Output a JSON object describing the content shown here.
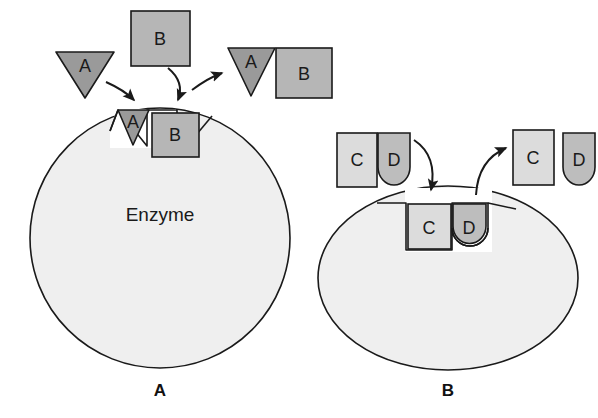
{
  "figure": {
    "background_color": "#ffffff"
  },
  "colors": {
    "enzyme_fill": "#efefef",
    "enzyme_stroke": "#1a1a1a",
    "substrate_a_fill": "#9a9a9a",
    "substrate_b_fill": "#b6b6b6",
    "substrate_c_fill": "#dcdcdc",
    "substrate_d_fill": "#bdbdbd",
    "shape_stroke": "#1a1a1a",
    "arrow_color": "#1a1a1a",
    "text_color": "#1a1a1a"
  },
  "panels": [
    {
      "id": "panel-a",
      "label": "A",
      "enzyme_label": "Enzyme",
      "enzyme_shape": "circle",
      "free_substrates": [
        {
          "id": "free-a",
          "label": "A",
          "shape": "triangle-down",
          "fill": "#9a9a9a"
        },
        {
          "id": "free-b",
          "label": "B",
          "shape": "square",
          "fill": "#b6b6b6"
        }
      ],
      "bound_substrates": [
        {
          "id": "bound-a",
          "label": "A",
          "shape": "triangle-down",
          "fill": "#9a9a9a"
        },
        {
          "id": "bound-b",
          "label": "B",
          "shape": "square",
          "fill": "#b6b6b6"
        }
      ],
      "product": {
        "id": "product-ab",
        "parts": [
          {
            "id": "product-a",
            "label": "A",
            "shape": "triangle-down",
            "fill": "#9a9a9a"
          },
          {
            "id": "product-b",
            "label": "B",
            "shape": "square",
            "fill": "#b6b6b6"
          }
        ]
      },
      "arrows": [
        {
          "id": "arrow-a-binding",
          "direction": "down-right",
          "from": "free-a",
          "to": "bound-a"
        },
        {
          "id": "arrow-b-binding",
          "direction": "down",
          "from": "free-b",
          "to": "bound-b"
        },
        {
          "id": "arrow-ab-release",
          "direction": "up-right",
          "from": "active-site",
          "to": "product-ab"
        }
      ]
    },
    {
      "id": "panel-b",
      "label": "B",
      "enzyme_shape": "ellipse",
      "free_substrates": [
        {
          "id": "free-c",
          "label": "C",
          "shape": "square",
          "fill": "#dcdcdc"
        },
        {
          "id": "free-d",
          "label": "D",
          "shape": "round-bottom",
          "fill": "#bdbdbd"
        }
      ],
      "bound_substrates": [
        {
          "id": "bound-c",
          "label": "C",
          "shape": "square",
          "fill": "#dcdcdc"
        },
        {
          "id": "bound-d",
          "label": "D",
          "shape": "round-bottom",
          "fill": "#bdbdbd"
        }
      ],
      "products": [
        {
          "id": "product-c",
          "label": "C",
          "shape": "square",
          "fill": "#dcdcdc"
        },
        {
          "id": "product-d",
          "label": "D",
          "shape": "round-bottom",
          "fill": "#bdbdbd"
        }
      ],
      "arrows": [
        {
          "id": "arrow-cd-binding",
          "direction": "down-right",
          "from": "free-cd",
          "to": "bound-cd"
        },
        {
          "id": "arrow-cd-release",
          "direction": "up-right",
          "from": "active-site",
          "to": "product-c"
        }
      ]
    }
  ]
}
